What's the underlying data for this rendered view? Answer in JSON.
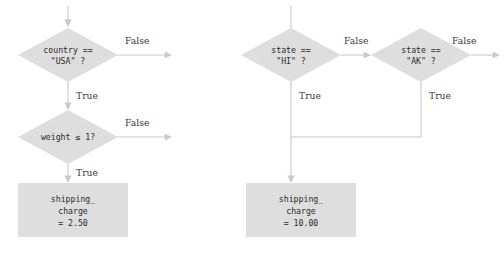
{
  "diagram": {
    "type": "flowchart",
    "background_color": "#ffffff",
    "shape_fill_color": "#dedede",
    "line_color": "#c9c9c9",
    "text_color": "#2b2b2b",
    "labels": {
      "true": "True",
      "false": "False"
    },
    "left_flow": {
      "decision_country": {
        "line1": "country ==",
        "line2": "\"USA\" ?",
        "false_label": "False",
        "true_label": "True"
      },
      "decision_weight": {
        "line1": "weight ≤ 1?",
        "false_label": "False",
        "true_label": "True"
      },
      "process_charge": {
        "line1": "shipping_",
        "line2": "charge",
        "line3": "= 2.50"
      }
    },
    "right_flow": {
      "decision_state_hi": {
        "line1": "state ==",
        "line2": "\"HI\" ?",
        "false_label": "False",
        "true_label": "True"
      },
      "decision_state_ak": {
        "line1": "state ==",
        "line2": "\"AK\" ?",
        "false_label": "False",
        "true_label": "True"
      },
      "process_charge": {
        "line1": "shipping_",
        "line2": "charge",
        "line3": "= 10.00"
      }
    }
  }
}
